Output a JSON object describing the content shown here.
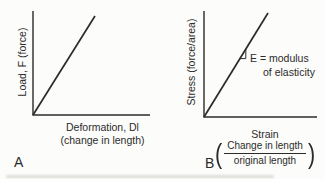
{
  "colors": {
    "ink": "#2b2b2b",
    "background": "#fcfcfa"
  },
  "panel_a": {
    "panel_label": "A",
    "y_axis_label": "Load, F (force)",
    "x_axis_label": "Deformation, Dl",
    "x_axis_sublabel": "(change in length)"
  },
  "panel_b": {
    "panel_label": "B",
    "y_axis_label": "Stress (force/area)",
    "x_axis_label": "Strain",
    "fraction": {
      "open_paren": "(",
      "numerator": "Change in length",
      "denominator": "original length",
      "close_paren": ")"
    },
    "annotation_line1": "E = modulus",
    "annotation_line2": "of elasticity"
  }
}
